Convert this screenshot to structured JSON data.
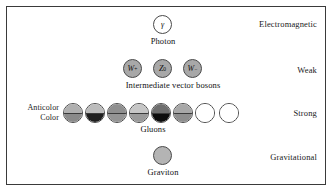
{
  "figure": {
    "border_color": "#3a3a3a",
    "background": "#ffffff"
  },
  "forces": [
    {
      "name": "electromagnetic",
      "label": "Electromagnetic"
    },
    {
      "name": "weak",
      "label": "Weak"
    },
    {
      "name": "strong",
      "label": "Strong"
    },
    {
      "name": "gravitational",
      "label": "Gravitational"
    }
  ],
  "rows": {
    "electromagnetic": {
      "caption": "Photon",
      "particles": [
        {
          "name": "photon",
          "glyph": "γ",
          "fill": "#ffffff"
        }
      ]
    },
    "weak": {
      "caption": "Intermediate vector bosons",
      "particles": [
        {
          "name": "w-plus-boson",
          "symbol": "W",
          "charge": "+",
          "fill": "#a8a8a8"
        },
        {
          "name": "z-zero-boson",
          "symbol": "Z",
          "charge": "0",
          "fill": "#a8a8a8"
        },
        {
          "name": "w-minus-boson",
          "symbol": "W",
          "charge": "−",
          "fill": "#a8a8a8"
        }
      ]
    },
    "strong": {
      "caption": "Gluons",
      "axis_labels": {
        "anticolor": "Anticolor",
        "color": "Color"
      },
      "particles": [
        {
          "name": "gluon-1",
          "anticolor": "#b0b0b0",
          "color": "#8a8a8a"
        },
        {
          "name": "gluon-2",
          "anticolor": "#bcbcbc",
          "color": "#1f1f1f"
        },
        {
          "name": "gluon-3",
          "anticolor": "#8f8f8f",
          "color": "#949494"
        },
        {
          "name": "gluon-4",
          "anticolor": "#c6c6c6",
          "color": "#9a9a9a"
        },
        {
          "name": "gluon-5",
          "anticolor": "#6e6e6e",
          "color": "#0d0d0d"
        },
        {
          "name": "gluon-6",
          "anticolor": "#a8a8a8",
          "color": "#8e8e8e"
        },
        {
          "name": "gluon-7",
          "anticolor": "#ffffff",
          "color": "#ffffff"
        },
        {
          "name": "gluon-8",
          "anticolor": "#ffffff",
          "color": "#ffffff"
        }
      ]
    },
    "gravitational": {
      "caption": "Graviton",
      "particles": [
        {
          "name": "graviton",
          "glyph": "",
          "fill": "#b4b4b4"
        }
      ]
    }
  }
}
